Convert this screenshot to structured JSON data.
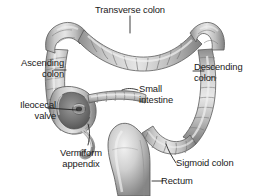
{
  "figure": {
    "background_color": "#ffffff",
    "text_color": "#1a1a1a",
    "organ_light": "#d2d2d2",
    "organ_mid": "#a8a8a8",
    "organ_dark": "#6e6e6e",
    "organ_outline": "#5a5a5a",
    "leader_color": "#1a1a1a"
  },
  "labels": {
    "transverse_colon": "Transverse colon",
    "ascending_colon": "Ascending\ncolon",
    "descending_colon": "Descending\ncolon",
    "ileocecal_valve": "Ileocecal\nvalve",
    "small_intestine": "Small\nintestine",
    "vermiform_appendix": "Vermiform\nappendix",
    "sigmoid_colon": "Sigmoid colon",
    "rectum": "Rectum"
  },
  "structures": [
    {
      "name": "transverse-colon",
      "label": "Transverse colon"
    },
    {
      "name": "ascending-colon",
      "label": "Ascending colon"
    },
    {
      "name": "descending-colon",
      "label": "Descending colon"
    },
    {
      "name": "cecum",
      "label": "Cecum"
    },
    {
      "name": "ileocecal-valve",
      "label": "Ileocecal valve"
    },
    {
      "name": "small-intestine",
      "label": "Small intestine"
    },
    {
      "name": "vermiform-appendix",
      "label": "Vermiform appendix"
    },
    {
      "name": "sigmoid-colon",
      "label": "Sigmoid colon"
    },
    {
      "name": "rectum",
      "label": "Rectum"
    }
  ]
}
